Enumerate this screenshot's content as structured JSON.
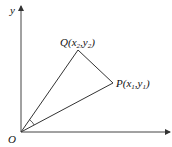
{
  "diagram": {
    "type": "coordinate-geometry",
    "axes": {
      "x_label": "",
      "y_label": "y",
      "origin_label": "O"
    },
    "points": [
      {
        "id": "Q",
        "name": "Q",
        "coord_x": "x",
        "coord_x_sub": "2",
        "coord_y": "y",
        "coord_y_sub": "2"
      },
      {
        "id": "P",
        "name": "P",
        "coord_x": "x",
        "coord_x_sub": "1",
        "coord_y": "y",
        "coord_y_sub": "1"
      }
    ],
    "segments": [
      "OQ",
      "QP",
      "OP"
    ],
    "angle_marked": "POQ",
    "colors": {
      "stroke": "#333333",
      "text": "#111111",
      "background": "#ffffff"
    }
  }
}
